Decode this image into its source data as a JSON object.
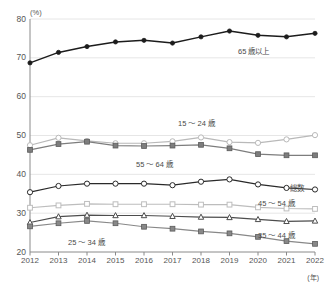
{
  "chart_data": {
    "type": "line",
    "title": "",
    "xlabel": "年",
    "ylabel": "(%)",
    "unit_y": "(%)",
    "unit_x": "(年)",
    "categories": [
      "2012",
      "2013",
      "2014",
      "2015",
      "2016",
      "2017",
      "2018",
      "2019",
      "2020",
      "2021",
      "2022"
    ],
    "x": [
      2012,
      2013,
      2014,
      2015,
      2016,
      2017,
      2018,
      2019,
      2020,
      2021,
      2022
    ],
    "ylim": [
      20,
      80
    ],
    "yticks": [
      20,
      30,
      40,
      50,
      60,
      70,
      80
    ],
    "grid": true,
    "legend_position": "inline-annotations",
    "series": [
      {
        "name": "65歳以上",
        "label": "65 歳以上",
        "marker": "filled-circle",
        "color": "#1c1c1c",
        "values": [
          68.7,
          71.4,
          72.9,
          74.1,
          74.5,
          73.8,
          75.4,
          76.9,
          75.8,
          75.4,
          76.3
        ]
      },
      {
        "name": "15～24歳",
        "label": "15 ～ 24 歳",
        "marker": "open-circle",
        "color": "#b9b9b9",
        "values": [
          47.5,
          49.4,
          48.6,
          48.0,
          48.0,
          48.5,
          49.5,
          48.3,
          48.1,
          49.0,
          50.1
        ]
      },
      {
        "name": "55～64歳",
        "label": "55 ～ 64 歳",
        "marker": "filled-square",
        "color": "#7d7d7d",
        "values": [
          46.3,
          47.8,
          48.4,
          47.4,
          47.3,
          47.4,
          47.6,
          46.7,
          45.2,
          44.9,
          44.9
        ]
      },
      {
        "name": "総数",
        "label": "総数",
        "marker": "open-circle",
        "color": "#2a2a2a",
        "values": [
          35.4,
          37.0,
          37.6,
          37.6,
          37.6,
          37.2,
          38.1,
          38.7,
          37.4,
          36.5,
          36.1
        ]
      },
      {
        "name": "45～54歳",
        "label": "45 ～ 54 歳",
        "marker": "open-square",
        "color": "#bdbdbd",
        "values": [
          31.4,
          32.0,
          32.4,
          32.3,
          32.3,
          32.3,
          32.2,
          32.2,
          31.5,
          31.2,
          31.1
        ]
      },
      {
        "name": "35～44歳",
        "label": "35 ～ 44 歳",
        "marker": "open-triangle",
        "color": "#4d4d4d",
        "values": [
          27.6,
          29.1,
          29.5,
          29.4,
          29.4,
          29.2,
          29.0,
          28.9,
          28.4,
          27.9,
          28.0
        ]
      },
      {
        "name": "25～34歳",
        "label": "25 ～ 34 歳",
        "marker": "filled-square",
        "color": "#888888",
        "values": [
          26.6,
          27.4,
          28.0,
          27.4,
          26.5,
          26.0,
          25.3,
          24.8,
          23.9,
          22.8,
          22.1
        ]
      }
    ],
    "annotations": [
      {
        "text": "65 歳以上",
        "series": "65歳以上"
      },
      {
        "text": "15 ～ 24 歳",
        "series": "15～24歳"
      },
      {
        "text": "55 ～ 64 歳",
        "series": "55～64歳"
      },
      {
        "text": "総数",
        "series": "総数"
      },
      {
        "text": "45 ～ 54 歳",
        "series": "45～54歳"
      },
      {
        "text": "35 ～ 44 歳",
        "series": "35～44歳"
      },
      {
        "text": "25 ～ 34 歳",
        "series": "25～34歳"
      }
    ]
  }
}
